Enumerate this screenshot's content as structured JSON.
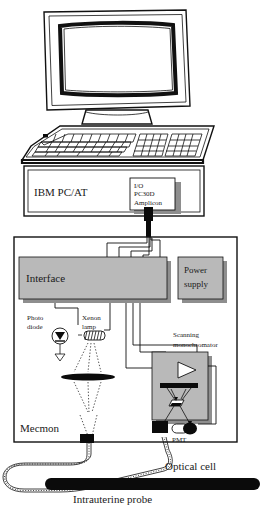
{
  "figure": {
    "kind": "instrumentation-schematic"
  },
  "labels": {
    "pc_unit": "IBM PC/AT",
    "io_card_line1": "I/O",
    "io_card_line2": "PC30D",
    "io_card_line3": "Amplicon",
    "interface": "Interface",
    "power_supply_line1": "Power",
    "power_supply_line2": "supply",
    "photo_diode_line1": "Photo",
    "photo_diode_line2": "diode",
    "xenon_lamp_line1": "Xenon",
    "xenon_lamp_line2": "lamp",
    "scanning_mono_line1": "Scanning",
    "scanning_mono_line2": "monochromator",
    "pmt": "PMT",
    "mecmon": "Mecmon",
    "optical_cell": "Optical cell",
    "intrauterine_probe": "Intrauterine probe"
  },
  "components": [
    {
      "id": "monitor",
      "name": "CRT monitor",
      "icon": "monitor-icon"
    },
    {
      "id": "keyboard",
      "name": "Keyboard",
      "icon": "keyboard-icon"
    },
    {
      "id": "pc",
      "name": "IBM PC/AT system unit",
      "icon": "computer-case-icon"
    },
    {
      "id": "io-card",
      "name": "Amplicon PC30D I/O card",
      "icon": "card-icon"
    },
    {
      "id": "interface",
      "name": "Interface module",
      "icon": "module-icon"
    },
    {
      "id": "power-supply",
      "name": "Power supply module",
      "icon": "module-icon"
    },
    {
      "id": "photo-diode",
      "name": "Photo diode",
      "icon": "photodiode-icon"
    },
    {
      "id": "xenon-lamp",
      "name": "Xenon lamp",
      "icon": "lamp-icon"
    },
    {
      "id": "lens",
      "name": "Focusing lens",
      "icon": "lens-icon"
    },
    {
      "id": "monochromator",
      "name": "Scanning monochromator",
      "icon": "monochromator-icon"
    },
    {
      "id": "pmt",
      "name": "Photomultiplier tube",
      "icon": "pmt-icon"
    },
    {
      "id": "mecmon-enclosure",
      "name": "Mecmon enclosure",
      "icon": "enclosure-icon"
    },
    {
      "id": "fiber-bundle",
      "name": "Fiber optic cable bundle",
      "icon": "fiber-icon"
    },
    {
      "id": "probe",
      "name": "Intrauterine probe with optical cell",
      "icon": "probe-icon"
    }
  ],
  "colors": {
    "ink": "#111111",
    "panel_fill": "#b9b9b9",
    "panel_shadow": "#8e8e8e",
    "probe_black": "#0b0b0b",
    "page_background": "#ffffff"
  }
}
